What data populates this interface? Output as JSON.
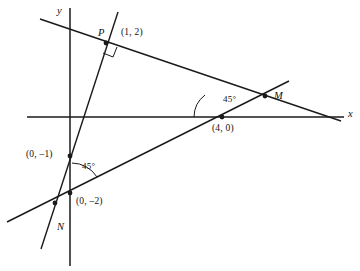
{
  "figure": {
    "type": "coordinate-geometry-diagram",
    "background_color": "#ffffff",
    "stroke_color": "#1a1a1a"
  },
  "axes": {
    "x_axis": {
      "label": "x",
      "label_x": 348,
      "label_y": 109,
      "start": [
        27,
        117
      ],
      "end": [
        344,
        117
      ]
    },
    "y_axis": {
      "label": "y",
      "label_x": 57,
      "label_y": 6,
      "start": [
        70,
        8
      ],
      "end": [
        70,
        266
      ]
    }
  },
  "lines": [
    {
      "name": "line-P-M",
      "from": [
        40,
        19
      ],
      "to": [
        341,
        121
      ],
      "description": "gentle negative slope line passing through P(1,2) and M"
    },
    {
      "name": "line-N-M",
      "from": [
        7,
        222
      ],
      "to": [
        289,
        81
      ],
      "description": "positive slope line through N, (0,-2), (4,0) and M"
    },
    {
      "name": "line-P-N",
      "from": [
        118,
        12
      ],
      "to": [
        41,
        249
      ],
      "description": "steep negative slope line through P, (0,-1) and N"
    }
  ],
  "points": [
    {
      "name": "point-P",
      "x": 106,
      "y": 43,
      "dot": true
    },
    {
      "name": "point-M",
      "x": 265,
      "y": 96,
      "dot": true
    },
    {
      "name": "point-N",
      "x": 55,
      "y": 203,
      "dot": true
    },
    {
      "name": "point-4-0",
      "x": 222,
      "y": 117,
      "dot": true
    },
    {
      "name": "point-0-neg1",
      "x": 70,
      "y": 156,
      "dot": true
    },
    {
      "name": "point-0-neg2",
      "x": 70,
      "y": 193,
      "dot": true
    }
  ],
  "labels": [
    {
      "name": "label-P",
      "text": "P",
      "x": 98,
      "y": 28,
      "italic": true
    },
    {
      "name": "label-P-coords",
      "text": "(1, 2)",
      "x": 121,
      "y": 28,
      "italic": false
    },
    {
      "name": "label-M",
      "text": "M",
      "x": 274,
      "y": 91,
      "italic": true
    },
    {
      "name": "label-N",
      "text": "N",
      "x": 57,
      "y": 222,
      "italic": true
    },
    {
      "name": "label-4-0",
      "text": "(4, 0)",
      "x": 212,
      "y": 124,
      "italic": false
    },
    {
      "name": "label-0-neg1",
      "text": "(0, –1)",
      "x": 26,
      "y": 150,
      "italic": false
    },
    {
      "name": "label-0-neg2",
      "text": "(0, –2)",
      "x": 76,
      "y": 197,
      "italic": false
    }
  ],
  "angle_marks": [
    {
      "name": "angle-45-at-4-0",
      "text": "45°",
      "label_x": 223,
      "label_y": 95,
      "vertex": [
        222,
        117
      ],
      "radius": 28
    },
    {
      "name": "angle-45-at-0-neg2",
      "text": "45°",
      "label_x": 82,
      "label_y": 162,
      "vertex": [
        70,
        193
      ],
      "radius": 30
    }
  ],
  "right_angle": {
    "name": "right-angle-at-P",
    "vertex": [
      106,
      43
    ],
    "size": 11,
    "description": "square marker indicating perpendicular lines at P"
  }
}
